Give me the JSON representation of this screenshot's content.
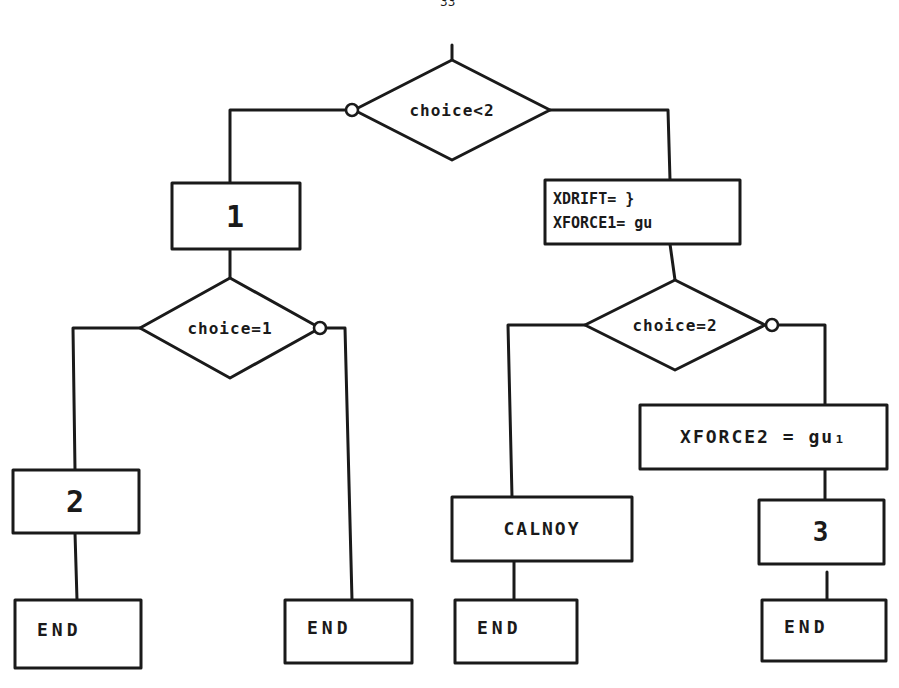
{
  "page": {
    "number": "33",
    "ink_color": "#1a1a1a",
    "paper_color": "#ffffff"
  },
  "diagram": {
    "type": "flowchart",
    "style": "hand-drawn",
    "decisions": [
      {
        "id": "d0",
        "label": "choice<2",
        "cx": 452,
        "cy": 110,
        "hw": 98,
        "hh": 50,
        "no_branch_side": "left"
      },
      {
        "id": "d1",
        "label": "choice=1",
        "cx": 230,
        "cy": 328,
        "hw": 90,
        "hh": 50,
        "no_branch_side": "right"
      },
      {
        "id": "d2",
        "label": "choice=2",
        "cx": 675,
        "cy": 325,
        "hw": 90,
        "hh": 45,
        "no_branch_side": "right"
      }
    ],
    "processes": [
      {
        "id": "p1",
        "label": "1",
        "x": 172,
        "y": 183,
        "w": 128,
        "h": 66,
        "font": 30
      },
      {
        "id": "p_xdrift",
        "lines": [
          "XDRIFT= }",
          "XFORCE1= gu"
        ],
        "x": 545,
        "y": 180,
        "w": 195,
        "h": 64,
        "font": 15
      },
      {
        "id": "p_xforce2",
        "label": "XFORCE2 = gu₁",
        "x": 640,
        "y": 405,
        "w": 247,
        "h": 64,
        "font": 18
      },
      {
        "id": "p2",
        "label": "2",
        "x": 13,
        "y": 470,
        "w": 126,
        "h": 63,
        "font": 30
      },
      {
        "id": "p_calnoy",
        "label": "CALNOY",
        "x": 452,
        "y": 497,
        "w": 180,
        "h": 64,
        "font": 18
      },
      {
        "id": "p3",
        "label": "3",
        "x": 759,
        "y": 500,
        "w": 125,
        "h": 64,
        "font": 26
      }
    ],
    "terminals": [
      {
        "id": "end1",
        "label": "END",
        "x": 15,
        "y": 600,
        "w": 126,
        "h": 68
      },
      {
        "id": "end2",
        "label": "END",
        "x": 285,
        "y": 600,
        "w": 127,
        "h": 63
      },
      {
        "id": "end3",
        "label": "END",
        "x": 455,
        "y": 600,
        "w": 122,
        "h": 63
      },
      {
        "id": "end4",
        "label": "END",
        "x": 762,
        "y": 600,
        "w": 124,
        "h": 61
      }
    ],
    "connectors": [
      {
        "from": "start",
        "to": "d0",
        "points": [
          [
            452,
            45
          ],
          [
            452,
            60
          ]
        ]
      },
      {
        "from": "d0",
        "to": "p1",
        "branch": "no",
        "points": [
          [
            346,
            110
          ],
          [
            230,
            110
          ],
          [
            230,
            183
          ]
        ]
      },
      {
        "from": "d0",
        "to": "p_xdrift",
        "branch": "yes",
        "points": [
          [
            550,
            110
          ],
          [
            668,
            110
          ],
          [
            670,
            180
          ]
        ]
      },
      {
        "from": "p1",
        "to": "d1",
        "points": [
          [
            230,
            249
          ],
          [
            230,
            278
          ]
        ]
      },
      {
        "from": "d1",
        "to": "p2",
        "branch": "yes",
        "points": [
          [
            140,
            328
          ],
          [
            73,
            328
          ],
          [
            75,
            470
          ]
        ]
      },
      {
        "from": "d1",
        "to": "end2",
        "branch": "no",
        "points": [
          [
            326,
            328
          ],
          [
            345,
            328
          ],
          [
            352,
            600
          ]
        ]
      },
      {
        "from": "p_xdrift",
        "to": "d2",
        "points": [
          [
            670,
            244
          ],
          [
            675,
            280
          ]
        ]
      },
      {
        "from": "d2",
        "to": "p_calnoy",
        "branch": "yes",
        "points": [
          [
            585,
            325
          ],
          [
            508,
            325
          ],
          [
            512,
            497
          ]
        ]
      },
      {
        "from": "d2",
        "to": "p_xforce2",
        "branch": "no",
        "points": [
          [
            771,
            325
          ],
          [
            825,
            325
          ],
          [
            825,
            405
          ]
        ]
      },
      {
        "from": "p2",
        "to": "end1",
        "points": [
          [
            75,
            533
          ],
          [
            77,
            600
          ]
        ]
      },
      {
        "from": "p_calnoy",
        "to": "end3",
        "points": [
          [
            514,
            561
          ],
          [
            514,
            600
          ]
        ]
      },
      {
        "from": "p_xforce2",
        "to": "p3",
        "points": [
          [
            825,
            469
          ],
          [
            825,
            500
          ]
        ]
      },
      {
        "from": "p3",
        "to": "end4",
        "points": [
          [
            827,
            572
          ],
          [
            827,
            600
          ]
        ]
      }
    ],
    "negation_circles": [
      {
        "on": "d0",
        "cx": 352,
        "cy": 110,
        "r": 6
      },
      {
        "on": "d1",
        "cx": 320,
        "cy": 328,
        "r": 6
      },
      {
        "on": "d2",
        "cx": 772,
        "cy": 325,
        "r": 6
      }
    ]
  }
}
